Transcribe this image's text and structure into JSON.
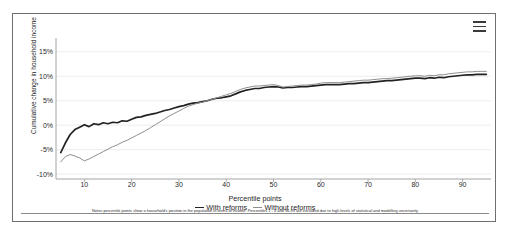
{
  "card": {
    "menu_icon": "hamburger-menu-icon"
  },
  "chart_data": {
    "type": "line",
    "title": "",
    "xlabel": "Percentile points",
    "ylabel": "Cumulative change in household income",
    "xlim": [
      4,
      96
    ],
    "ylim": [
      -11,
      17
    ],
    "grid": true,
    "legend_position": "bottom",
    "y_ticks": [
      "15%",
      "10%",
      "5%",
      "0%",
      "-5%",
      "-10%"
    ],
    "y_tick_values": [
      15,
      10,
      5,
      0,
      -5,
      -10
    ],
    "x_ticks": [
      "10",
      "20",
      "30",
      "40",
      "50",
      "60",
      "70",
      "80",
      "90"
    ],
    "x_tick_values": [
      10,
      20,
      30,
      40,
      50,
      60,
      70,
      80,
      90
    ],
    "note": "Notes:percentile points show a household's position in the population in terms of income. Percentiles 1 - 4 and 96-99 are excluded due to high levels of statistical and modelling uncertainty",
    "colors": {
      "with_reforms": "#222222",
      "without_reforms": "#8e8e8e"
    },
    "x": [
      5,
      6,
      7,
      8,
      9,
      10,
      11,
      12,
      13,
      14,
      15,
      16,
      17,
      18,
      19,
      20,
      21,
      22,
      23,
      24,
      25,
      26,
      27,
      28,
      29,
      30,
      31,
      32,
      33,
      34,
      35,
      36,
      37,
      38,
      39,
      40,
      41,
      42,
      43,
      44,
      45,
      46,
      47,
      48,
      49,
      50,
      51,
      52,
      53,
      54,
      55,
      56,
      57,
      58,
      59,
      60,
      61,
      62,
      63,
      64,
      65,
      66,
      67,
      68,
      69,
      70,
      71,
      72,
      73,
      74,
      75,
      76,
      77,
      78,
      79,
      80,
      81,
      82,
      83,
      84,
      85,
      86,
      87,
      88,
      89,
      90,
      91,
      92,
      93,
      94,
      95
    ],
    "series": [
      {
        "name": "With reforms",
        "values": [
          -5.6,
          -3.6,
          -1.9,
          -0.9,
          -0.4,
          0.1,
          -0.3,
          0.3,
          0.1,
          0.5,
          0.3,
          0.6,
          0.5,
          0.9,
          0.8,
          1.2,
          1.6,
          1.7,
          2.0,
          2.2,
          2.4,
          2.7,
          3.0,
          3.2,
          3.5,
          3.8,
          4.0,
          4.3,
          4.5,
          4.6,
          4.8,
          5.0,
          5.3,
          5.5,
          5.6,
          5.8,
          6.0,
          6.4,
          6.8,
          7.1,
          7.3,
          7.5,
          7.5,
          7.7,
          7.8,
          7.9,
          7.8,
          7.6,
          7.7,
          7.7,
          7.8,
          7.9,
          7.9,
          8.0,
          8.1,
          8.2,
          8.3,
          8.3,
          8.3,
          8.3,
          8.4,
          8.5,
          8.5,
          8.6,
          8.7,
          8.7,
          8.8,
          8.9,
          9.0,
          9.1,
          9.1,
          9.2,
          9.3,
          9.4,
          9.5,
          9.6,
          9.6,
          9.5,
          9.7,
          9.6,
          9.8,
          9.7,
          9.9,
          10.0,
          10.1,
          10.2,
          10.3,
          10.3,
          10.4,
          10.4,
          10.4
        ]
      },
      {
        "name": "Without reforms",
        "values": [
          -7.5,
          -6.4,
          -6.0,
          -6.3,
          -6.7,
          -7.3,
          -6.9,
          -6.4,
          -5.9,
          -5.4,
          -4.9,
          -4.4,
          -4.0,
          -3.5,
          -3.1,
          -2.6,
          -2.1,
          -1.6,
          -1.1,
          -0.5,
          0.1,
          0.7,
          1.3,
          1.9,
          2.4,
          2.9,
          3.4,
          3.9,
          4.2,
          4.5,
          4.7,
          5.0,
          5.3,
          5.6,
          5.9,
          6.2,
          6.5,
          6.9,
          7.3,
          7.6,
          7.8,
          8.0,
          8.0,
          8.1,
          8.2,
          8.3,
          8.1,
          7.8,
          7.9,
          8.0,
          8.1,
          8.2,
          8.2,
          8.3,
          8.4,
          8.6,
          8.7,
          8.7,
          8.7,
          8.7,
          8.8,
          8.9,
          9.0,
          9.1,
          9.2,
          9.2,
          9.3,
          9.4,
          9.5,
          9.5,
          9.6,
          9.7,
          9.8,
          9.9,
          10.0,
          10.1,
          10.1,
          10.0,
          10.2,
          10.1,
          10.3,
          10.3,
          10.5,
          10.6,
          10.7,
          10.8,
          10.9,
          10.9,
          11.0,
          11.0,
          11.0
        ]
      }
    ]
  }
}
